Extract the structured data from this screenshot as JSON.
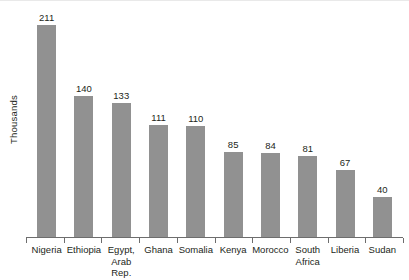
{
  "chart_data": {
    "type": "bar",
    "title": "",
    "xlabel": "",
    "ylabel": "Thousands",
    "categories": [
      "Nigeria",
      "Ethiopia",
      "Egypt,\nArab Rep.",
      "Ghana",
      "Somalia",
      "Kenya",
      "Morocco",
      "South\nAfrica",
      "Liberia",
      "Sudan"
    ],
    "values": [
      211,
      140,
      133,
      111,
      110,
      85,
      84,
      81,
      67,
      40
    ],
    "value_labels": [
      "211",
      "140",
      "133",
      "111",
      "110",
      "85",
      "84",
      "81",
      "67",
      "40"
    ],
    "ylim": [
      0,
      211
    ],
    "grid": false,
    "legend": "none",
    "bar_color": "#919191",
    "axis_color": "#6d6d6d",
    "text_color": "#231f20"
  }
}
